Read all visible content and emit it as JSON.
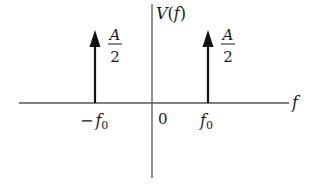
{
  "diagram": {
    "y_axis_label": {
      "name": "V",
      "arg": "f",
      "text": "V(f)"
    },
    "x_axis_label": "f",
    "origin_label": "0",
    "impulses": [
      {
        "position_label": {
          "sign": "−",
          "symbol": "f",
          "subscript": "0",
          "text": "−f0"
        },
        "amplitude": {
          "numerator": "A",
          "denominator": "2",
          "text": "A/2"
        }
      },
      {
        "position_label": {
          "sign": "",
          "symbol": "f",
          "subscript": "0",
          "text": "f0"
        },
        "amplitude": {
          "numerator": "A",
          "denominator": "2",
          "text": "A/2"
        }
      }
    ],
    "colors": {
      "axis": "#555555",
      "impulse": "#111111",
      "text": "#1a1a1a",
      "background": "#ffffff"
    }
  }
}
